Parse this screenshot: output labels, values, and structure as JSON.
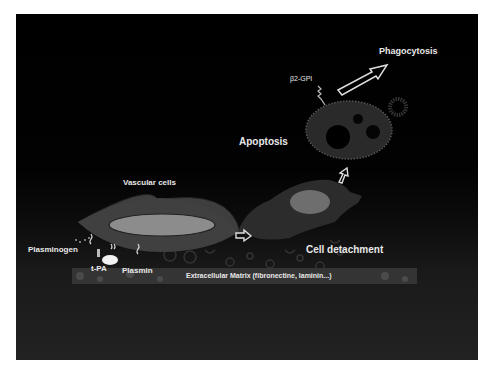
{
  "diagram": {
    "labels": {
      "phagocytosis": "Phagocytosis",
      "b2gpi": "β2-GPI",
      "apoptosis": "Apoptosis",
      "vascular_cells": "Vascular cells",
      "cell_detachment": "Cell detachment",
      "plasminogen": "Plasminogen",
      "tpa": "t-PA",
      "plasmin": "Plasmin",
      "ecm": "Extracellular Matrix (fibronectine, laminin...)"
    },
    "colors": {
      "background": "#000000",
      "cell_body": "#3c3c3c",
      "nucleus": "#8a8a8a",
      "apoptotic_body": "#2e2e2e",
      "text": "#e8e8e8"
    }
  }
}
